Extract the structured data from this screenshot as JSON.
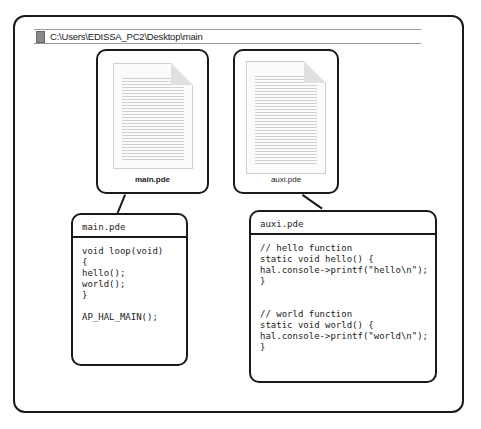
{
  "pathbar": {
    "path": "C:\\Users\\EDISSA_PC2\\Desktop\\main"
  },
  "icons": [
    {
      "label": "main.pde",
      "icon": "document-icon"
    },
    {
      "label": "auxi.pde",
      "icon": "document-icon"
    }
  ],
  "code_boxes": [
    {
      "title": "main.pde",
      "code": "void loop(void)\n{\nhello();\nworld();\n}\n\nAP_HAL_MAIN();"
    },
    {
      "title": "auxi.pde",
      "code": "// hello function\nstatic void hello() {\nhal.console->printf(\"hello\\n\");\n}\n\n\n// world function\nstatic void world() {\nhal.console->printf(\"world\\n\");\n}"
    }
  ]
}
